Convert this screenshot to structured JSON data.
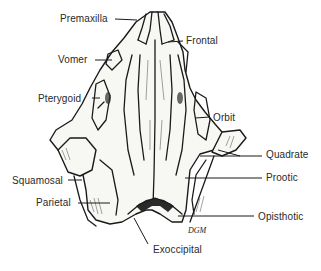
{
  "figure": {
    "signature": "DGM"
  },
  "labels": [
    {
      "id": "premaxilla",
      "text": "Premaxilla",
      "x": 60,
      "y": 15
    },
    {
      "id": "frontal",
      "text": "Frontal",
      "x": 186,
      "y": 37
    },
    {
      "id": "vomer",
      "text": "Vomer",
      "x": 58,
      "y": 55
    },
    {
      "id": "pterygoid",
      "text": "Pterygoid",
      "x": 38,
      "y": 93
    },
    {
      "id": "orbit",
      "text": "Orbit",
      "x": 213,
      "y": 112
    },
    {
      "id": "quadrate",
      "text": "Quadrate",
      "x": 266,
      "y": 150
    },
    {
      "id": "prootic",
      "text": "Prootic",
      "x": 266,
      "y": 173
    },
    {
      "id": "squamosal",
      "text": "Squamosal",
      "x": 12,
      "y": 176
    },
    {
      "id": "parietal",
      "text": "Parietal",
      "x": 36,
      "y": 198
    },
    {
      "id": "opisthotic",
      "text": "Opisthotic",
      "x": 258,
      "y": 212
    },
    {
      "id": "exoccipital",
      "text": "Exoccipital",
      "x": 153,
      "y": 245
    }
  ]
}
